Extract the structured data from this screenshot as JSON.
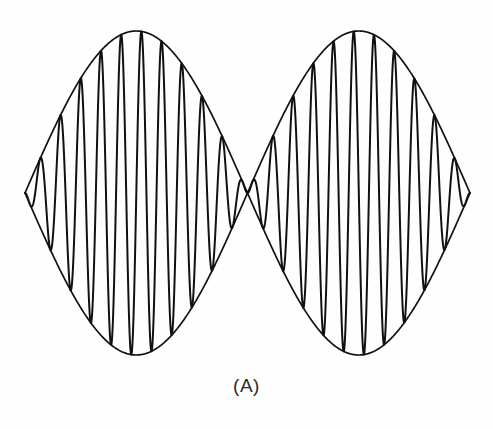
{
  "figure": {
    "caption": "(A)",
    "alt_description": "Amplitude-modulated carrier waveform with suppressed-carrier envelope crossing at center",
    "background_color": "#fefefe",
    "ink_color": "#111111",
    "caption_color": "#2b2b2b"
  },
  "chart_data": {
    "type": "line",
    "title": "",
    "subtitle": "",
    "xlabel": "",
    "ylabel": "",
    "grid": false,
    "legend": "none",
    "annotations": [
      "(A)"
    ],
    "axes": {
      "x_min": 0,
      "x_max": 1,
      "y_min": -1,
      "y_max": 1,
      "x_ticks": [],
      "y_ticks": []
    },
    "geometry_px": {
      "canvas_width": 493,
      "canvas_height": 429,
      "baseline_y": 193,
      "x_start": 25,
      "x_end": 470,
      "envelope_peak_amplitude": 162,
      "envelope_peak_left_x": 122,
      "envelope_peak_right_x": 368,
      "envelope_zero_center_x": 246,
      "top_extreme_y": 31,
      "bottom_extreme_y": 355
    },
    "signal": {
      "description": "Double-sideband suppressed-carrier amplitude modulation",
      "carrier_cycles_total": 22,
      "modulation_lobes": 2,
      "envelope_function": "A * |sin(pi * t)| with 180 degree phase reversal at t = 0.5",
      "carrier_function": "cos(2*pi*f_c*t)",
      "carrier_frequency_ratio": 22,
      "envelope_amplitude": 1.0,
      "phase_reversal_at": 0.5,
      "edge_partial_cycle": true
    },
    "series": [
      {
        "name": "modulated-carrier",
        "stroke": "#111111",
        "stroke_width": 2.0
      },
      {
        "name": "upper-envelope",
        "stroke": "#111111",
        "stroke_width": 1.7
      },
      {
        "name": "lower-envelope",
        "stroke": "#111111",
        "stroke_width": 1.7
      }
    ],
    "categories": [],
    "values": []
  }
}
